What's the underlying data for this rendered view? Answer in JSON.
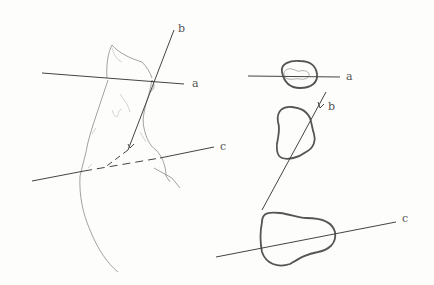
{
  "figure": {
    "left_view": {
      "description": "limb sketch with section lines",
      "labels": {
        "a": "a",
        "b": "b",
        "c": "c"
      }
    },
    "right_view": {
      "description": "cross sections at lines a, b, c",
      "labels": {
        "a": "a",
        "b": "b",
        "c": "c"
      }
    },
    "colors": {
      "ink": "#444444",
      "sketch": "#8a8a8a",
      "background": "#fdfdfc"
    }
  }
}
